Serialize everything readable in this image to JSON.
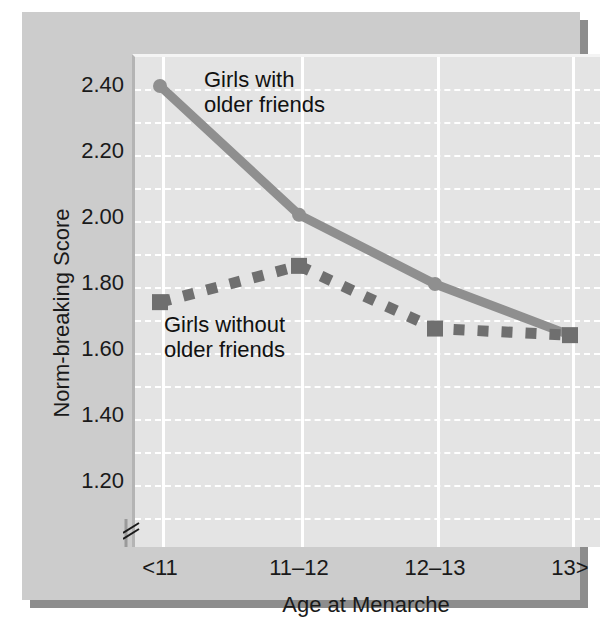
{
  "figure": {
    "background_color": "#cccccc",
    "plot_background_color": "#e4e4e4",
    "gridline_color": "#ffffff"
  },
  "axis_break_icon": "axis-break-icon",
  "chart_data": {
    "type": "line",
    "title": "",
    "xlabel": "Age at Menarche",
    "ylabel": "Norm-breaking Score",
    "categories": [
      "<11",
      "11–12",
      "12–13",
      "13>"
    ],
    "ytick_labels": [
      "1.20",
      "1.40",
      "1.60",
      "1.80",
      "2.00",
      "2.20",
      "2.40"
    ],
    "ytick_values": [
      1.2,
      1.4,
      1.6,
      1.8,
      2.0,
      2.2,
      2.4
    ],
    "ylim": [
      1.12,
      2.46
    ],
    "grid": "horizontal dashed white, vertical solid white",
    "legend_position": "inline annotations",
    "axis_break": true,
    "series": [
      {
        "name": "Girls with older friends",
        "style": "solid",
        "color": "#8f8f8f",
        "marker": "circle",
        "values": [
          2.4,
          2.01,
          1.8,
          1.645
        ]
      },
      {
        "name": "Girls without older friends",
        "style": "dotted",
        "color": "#6f6f6f",
        "marker": "square",
        "values": [
          1.745,
          1.855,
          1.665,
          1.645
        ]
      }
    ],
    "annotations": [
      {
        "text": "Girls with\nolder friends",
        "series": "Girls with older friends"
      },
      {
        "text": "Girls without\nolder friends",
        "series": "Girls without older friends"
      }
    ]
  }
}
